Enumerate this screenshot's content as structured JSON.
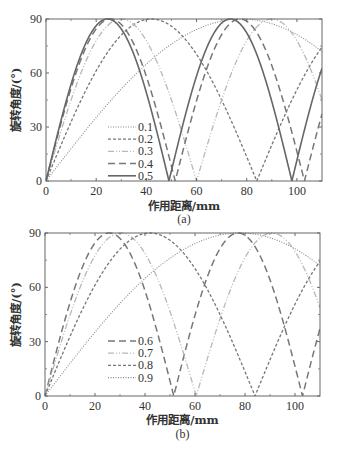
{
  "chart_data": [
    {
      "type": "line",
      "panel_label": "(a)",
      "title": "",
      "xlabel": "作用距离/mm",
      "ylabel": "旋转角度/(°)",
      "xlim": [
        0,
        110
      ],
      "ylim": [
        0,
        90
      ],
      "xticks": [
        0,
        20,
        40,
        60,
        80,
        100
      ],
      "yticks": [
        0,
        30,
        60,
        90
      ],
      "grid": false,
      "legend_position": "lower-center-left",
      "x": [
        0,
        10,
        20,
        30,
        40,
        50,
        60,
        70,
        80,
        90,
        100,
        110
      ],
      "series": [
        {
          "name": "0.1",
          "style": "dotted",
          "color": "#888888",
          "zero_spacing_mm": 156,
          "values": [
            0,
            18.0,
            35.3,
            51.1,
            64.9,
            76.1,
            84.2,
            88.8,
            89.9,
            87.4,
            81.3,
            71.9
          ]
        },
        {
          "name": "0.2",
          "style": "short-dash",
          "color": "#777777",
          "zero_spacing_mm": 84,
          "values": [
            0,
            32.9,
            61.2,
            81.1,
            89.7,
            86.0,
            70.4,
            45.0,
            13.4,
            20.1,
            50.7,
            74.3
          ]
        },
        {
          "name": "0.3",
          "style": "dash-dot-dot",
          "color": "#b8b8b8",
          "zero_spacing_mm": 60,
          "values": [
            0,
            45.0,
            77.9,
            90.0,
            77.9,
            45.0,
            0,
            45.0,
            77.9,
            90.0,
            77.9,
            45.0
          ]
        },
        {
          "name": "0.4",
          "style": "long-dash",
          "color": "#777777",
          "zero_spacing_mm": 51.5,
          "values": [
            0,
            51.6,
            84.5,
            87.0,
            58.1,
            8.2,
            44.6,
            81.3,
            88.7,
            64.0,
            16.4,
            37.0
          ]
        },
        {
          "name": "0.5",
          "style": "solid",
          "color": "#666666",
          "zero_spacing_mm": 49,
          "values": [
            0,
            53.8,
            86.3,
            84.4,
            49.2,
            5.8,
            58.3,
            87.8,
            82.3,
            44.6,
            11.5,
            63.2
          ]
        }
      ]
    },
    {
      "type": "line",
      "panel_label": "(b)",
      "title": "",
      "xlabel": "作用距离/mm",
      "ylabel": "旋转角度/(°)",
      "xlim": [
        0,
        110
      ],
      "ylim": [
        0,
        90
      ],
      "xticks": [
        0,
        20,
        40,
        60,
        80,
        100
      ],
      "yticks": [
        0,
        30,
        60,
        90
      ],
      "grid": false,
      "legend_position": "lower-center-left",
      "x": [
        0,
        10,
        20,
        30,
        40,
        50,
        60,
        70,
        80,
        90,
        100,
        110
      ],
      "series": [
        {
          "name": "0.6",
          "style": "long-dash",
          "color": "#777777",
          "zero_spacing_mm": 51.5,
          "values": [
            0,
            51.6,
            84.5,
            87.0,
            58.1,
            8.2,
            44.6,
            81.3,
            88.7,
            64.0,
            16.4,
            37.0
          ]
        },
        {
          "name": "0.7",
          "style": "dash-dot-dot",
          "color": "#b8b8b8",
          "zero_spacing_mm": 60.5,
          "values": [
            0,
            44.7,
            77.6,
            90.0,
            78.7,
            46.5,
            2.3,
            42.6,
            76.5,
            89.9,
            79.8,
            48.7
          ]
        },
        {
          "name": "0.8",
          "style": "short-dash",
          "color": "#777777",
          "zero_spacing_mm": 84,
          "values": [
            0,
            32.9,
            61.2,
            81.1,
            89.7,
            86.0,
            70.4,
            45.0,
            13.4,
            20.1,
            50.7,
            74.3
          ]
        },
        {
          "name": "0.9",
          "style": "dotted",
          "color": "#888888",
          "zero_spacing_mm": 156,
          "values": [
            0,
            18.0,
            35.3,
            51.1,
            64.9,
            76.1,
            84.2,
            88.8,
            89.9,
            87.4,
            81.3,
            71.9
          ]
        }
      ]
    }
  ],
  "layout": {
    "panels": [
      {
        "left": 46,
        "top": 19,
        "right": 322,
        "bottom": 181,
        "legend_x": 108,
        "legend_y": 127,
        "legend_dy": 12.2,
        "caption_y": 223,
        "xlabel_y": 210
      },
      {
        "left": 45,
        "top": 233,
        "right": 320,
        "bottom": 396,
        "legend_x": 108,
        "legend_y": 341,
        "legend_dy": 12.2,
        "caption_y": 438,
        "xlabel_y": 424
      }
    ]
  }
}
